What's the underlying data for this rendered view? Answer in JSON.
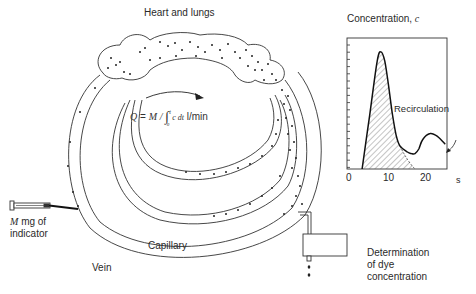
{
  "diagram": {
    "title_heart": "Heart and lungs",
    "formula": {
      "lhs": "Q",
      "eq": "=",
      "M": "M",
      "slash": "/",
      "integral": "∫",
      "upper": "t",
      "lower": "0",
      "integrand": "c dt",
      "units": "l/min"
    },
    "injection": {
      "var": "M",
      "line1_rest": "mg of",
      "line2": "indicator"
    },
    "capillary_label": "Capillary",
    "vein_label": "Vein",
    "detector_label": {
      "line1": "Determination",
      "line2": "of dye",
      "line3": "concentration"
    }
  },
  "chart_data": {
    "type": "area",
    "title": "Concentration, c",
    "ylabel": "Concentration, c",
    "xlabel": "s",
    "x_ticks": [
      "0",
      "10",
      "20"
    ],
    "xlim": [
      0,
      27
    ],
    "grid": false,
    "annotation": "Recirculation",
    "shaded_region": "first-pass curve area (hatched) extrapolated to baseline ~18 s",
    "x": [
      4,
      6,
      8,
      9,
      10,
      11,
      12,
      13,
      14,
      16,
      17,
      18,
      19,
      20,
      22,
      24,
      26
    ],
    "values": [
      0,
      3.5,
      7.0,
      7.6,
      7.0,
      5.4,
      3.6,
      2.2,
      1.5,
      1.1,
      1.0,
      1.0,
      1.3,
      1.9,
      2.3,
      2.1,
      1.6
    ],
    "ylim": [
      0,
      8.5
    ]
  }
}
